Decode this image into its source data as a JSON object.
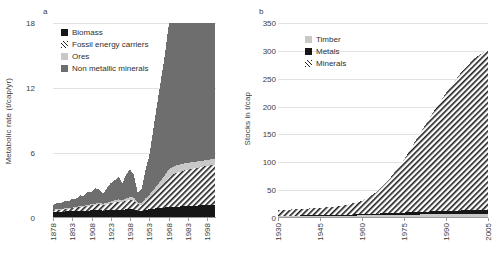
{
  "panels": {
    "a": {
      "label": "a",
      "ylabel": "Metabolic rate (t/cap/yr)"
    },
    "b": {
      "label": "b",
      "ylabel": "Stocks in t/cap"
    }
  },
  "legend_a": {
    "items": [
      {
        "label": "Biomass",
        "swatch": "black-square-icon"
      },
      {
        "label": "Fossil energy carriers",
        "swatch": "hatched-square-icon"
      },
      {
        "label": "Ores",
        "swatch": "light-gray-square-icon"
      },
      {
        "label": "Non metallic minerals",
        "swatch": "dark-gray-square-icon"
      }
    ]
  },
  "legend_b": {
    "items": [
      {
        "label": "Timber",
        "swatch": "light-gray-square-icon"
      },
      {
        "label": "Metals",
        "swatch": "black-square-icon"
      },
      {
        "label": "Minerals",
        "swatch": "hatched-square-icon"
      }
    ]
  },
  "colors": {
    "biomass": "#161616",
    "fossil_energy_carriers": "#1d1d1d",
    "ores": "#c8c8c8",
    "non_metallic_minerals": "#6e6e6e",
    "timber": "#c8c8c8",
    "metals": "#161616",
    "minerals": "#1d1d1d",
    "gridline": "#e2e2e2",
    "axis": "#9a9a9a",
    "text": "#3d3d3d"
  },
  "chart_data": [
    {
      "id": "a",
      "type": "area",
      "title": "a",
      "xlabel": "",
      "ylabel": "Metabolic rate (t/cap/yr)",
      "xlim": [
        1878,
        2005
      ],
      "ylim": [
        0,
        18
      ],
      "yticks": [
        0,
        6,
        12,
        18
      ],
      "xticks": [
        1878,
        1893,
        1908,
        1923,
        1938,
        1953,
        1968,
        1983,
        1998
      ],
      "grid": true,
      "legend_position": "upper-left",
      "stacked": true,
      "x": [
        1878,
        1881,
        1884,
        1887,
        1890,
        1893,
        1896,
        1899,
        1902,
        1905,
        1908,
        1911,
        1914,
        1917,
        1920,
        1923,
        1926,
        1929,
        1932,
        1935,
        1938,
        1941,
        1944,
        1947,
        1950,
        1953,
        1956,
        1959,
        1962,
        1965,
        1968,
        1971,
        1974,
        1977,
        1980,
        1983,
        1986,
        1989,
        1992,
        1995,
        1998,
        2001,
        2004
      ],
      "series": [
        {
          "name": "Biomass",
          "values": [
            0.55,
            0.58,
            0.58,
            0.6,
            0.62,
            0.62,
            0.64,
            0.66,
            0.66,
            0.68,
            0.7,
            0.7,
            0.72,
            0.68,
            0.7,
            0.74,
            0.76,
            0.78,
            0.76,
            0.8,
            0.82,
            0.8,
            0.66,
            0.62,
            0.74,
            0.82,
            0.86,
            0.9,
            0.92,
            0.96,
            1.0,
            1.02,
            1.04,
            1.06,
            1.08,
            1.1,
            1.12,
            1.14,
            1.16,
            1.18,
            1.2,
            1.22,
            1.22
          ]
        },
        {
          "name": "Fossil energy carriers",
          "values": [
            0.15,
            0.18,
            0.2,
            0.22,
            0.24,
            0.26,
            0.3,
            0.34,
            0.38,
            0.42,
            0.46,
            0.5,
            0.54,
            0.5,
            0.56,
            0.62,
            0.68,
            0.74,
            0.7,
            0.78,
            0.86,
            0.84,
            0.62,
            0.58,
            0.84,
            1.0,
            1.3,
            1.6,
            1.95,
            2.3,
            2.7,
            2.95,
            3.1,
            3.2,
            3.3,
            3.35,
            3.4,
            3.45,
            3.5,
            3.55,
            3.6,
            3.65,
            3.65
          ]
        },
        {
          "name": "Ores",
          "values": [
            0.05,
            0.05,
            0.06,
            0.06,
            0.07,
            0.07,
            0.08,
            0.09,
            0.1,
            0.11,
            0.12,
            0.13,
            0.14,
            0.12,
            0.14,
            0.16,
            0.18,
            0.2,
            0.18,
            0.22,
            0.26,
            0.24,
            0.16,
            0.14,
            0.22,
            0.3,
            0.4,
            0.5,
            0.58,
            0.66,
            0.74,
            0.72,
            0.7,
            0.68,
            0.66,
            0.64,
            0.62,
            0.6,
            0.58,
            0.56,
            0.55,
            0.54,
            0.54
          ]
        },
        {
          "name": "Non metallic minerals",
          "values": [
            0.45,
            0.55,
            0.5,
            0.7,
            0.6,
            0.85,
            0.75,
            1.0,
            0.9,
            1.2,
            1.1,
            1.4,
            1.25,
            0.95,
            1.35,
            1.7,
            1.85,
            2.1,
            1.55,
            2.2,
            2.55,
            2.1,
            0.9,
            1.3,
            2.6,
            3.6,
            5.5,
            7.4,
            9.2,
            11.0,
            13.2,
            15.6,
            13.0,
            15.0,
            12.8,
            14.6,
            14.0,
            15.8,
            13.6,
            15.2,
            14.4,
            13.6,
            12.8
          ]
        }
      ]
    },
    {
      "id": "b",
      "type": "area",
      "title": "b",
      "xlabel": "",
      "ylabel": "Stocks in t/cap",
      "xlim": [
        1930,
        2005
      ],
      "ylim": [
        0,
        350
      ],
      "yticks": [
        0,
        50,
        100,
        150,
        200,
        250,
        300,
        350
      ],
      "xticks": [
        1930,
        1945,
        1960,
        1975,
        1990,
        2005
      ],
      "grid": true,
      "legend_position": "upper-left",
      "stacked": true,
      "x": [
        1930,
        1935,
        1940,
        1945,
        1950,
        1955,
        1960,
        1965,
        1970,
        1975,
        1980,
        1985,
        1990,
        1995,
        2000,
        2005
      ],
      "series": [
        {
          "name": "Timber",
          "values": [
            3.0,
            3.2,
            3.4,
            3.6,
            3.8,
            4.2,
            4.6,
            5.0,
            5.4,
            5.8,
            6.2,
            6.6,
            7.0,
            7.4,
            7.8,
            8.0
          ]
        },
        {
          "name": "Metals",
          "values": [
            1.0,
            1.1,
            1.2,
            1.3,
            1.5,
            1.8,
            2.2,
            2.8,
            3.4,
            4.0,
            4.6,
            5.2,
            5.6,
            6.0,
            6.4,
            6.6
          ]
        },
        {
          "name": "Minerals",
          "values": [
            10.0,
            11.0,
            12.0,
            13.5,
            15.0,
            18.0,
            24.0,
            38.0,
            62.0,
            95.0,
            135.0,
            175.0,
            212.0,
            245.0,
            272.0,
            288.0
          ]
        }
      ]
    }
  ]
}
